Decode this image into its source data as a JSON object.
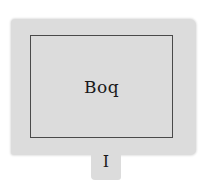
{
  "card": {
    "title": "Boq",
    "number": "I"
  },
  "colors": {
    "paper": "#dcdcdc",
    "frame": "#4a4a4a",
    "text": "#1a1a1a"
  }
}
